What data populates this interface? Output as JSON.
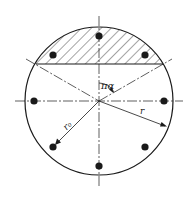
{
  "diagram": {
    "type": "circular-section-with-rebars",
    "labels": {
      "angle": "πα",
      "outer_radius": "r",
      "bar_radius": "r₀"
    },
    "geometry": {
      "center": [
        99,
        101
      ],
      "outer_radius": 74,
      "bar_circle_radius": 65,
      "bar_count": 8,
      "bar_dot_radius": 3.6,
      "compression_chord_y": 64
    },
    "colors": {
      "stroke": "#1a1a1a",
      "background": "#ffffff",
      "hatch": "#1a1a1a"
    }
  }
}
